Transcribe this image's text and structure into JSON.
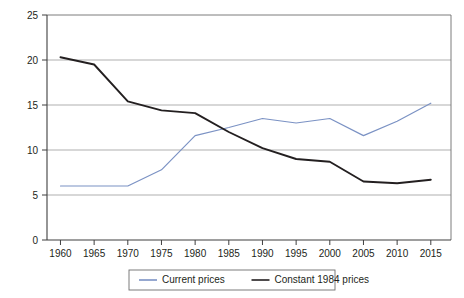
{
  "chart_data": {
    "type": "line",
    "title": "",
    "subtitle": "",
    "xlabel": "",
    "ylabel": "",
    "x": [
      1960,
      1965,
      1970,
      1975,
      1980,
      1985,
      1990,
      1995,
      2000,
      2005,
      2010,
      2015
    ],
    "xtick_labels": [
      "1960",
      "1965",
      "1970",
      "1975",
      "1980",
      "1985",
      "1990",
      "1995",
      "2000",
      "2005",
      "2010",
      "2015"
    ],
    "ytick_labels": [
      "0",
      "5",
      "10",
      "15",
      "20",
      "25"
    ],
    "yticks": [
      0,
      5,
      10,
      15,
      20,
      25
    ],
    "xlim": [
      1958,
      2018
    ],
    "ylim": [
      0,
      25
    ],
    "grid": true,
    "grid_axis": "y",
    "legend_position": "bottom-center",
    "series": [
      {
        "name": "Current prices",
        "color": "#7b92c4",
        "values": [
          6.0,
          6.0,
          6.0,
          7.8,
          11.6,
          12.5,
          13.5,
          13.0,
          13.5,
          11.6,
          13.2,
          15.2
        ]
      },
      {
        "name": "Constant 1984 prices",
        "color": "#231f20",
        "values": [
          20.3,
          19.5,
          15.4,
          14.4,
          14.1,
          12.0,
          10.2,
          9.0,
          8.7,
          6.5,
          6.3,
          6.7
        ]
      }
    ],
    "annotations": []
  },
  "legend": {
    "items": [
      {
        "label": "Current prices",
        "color": "#7b92c4"
      },
      {
        "label": "Constant 1984 prices",
        "color": "#231f20"
      }
    ]
  },
  "colors": {
    "series_current": "#7b92c4",
    "series_constant": "#231f20",
    "gridline": "#8c8c8c",
    "axis": "#3f3f3f",
    "background": "#ffffff"
  }
}
